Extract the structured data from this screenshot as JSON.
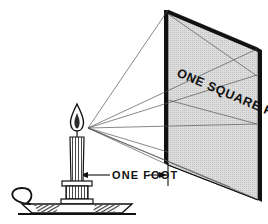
{
  "figure": {
    "background_color": "#ffffff",
    "ink_color": "#111111",
    "panel_fill_color": "#d9d9d9",
    "ray_color": "#555555",
    "width": 268,
    "height": 224
  },
  "labels": {
    "panel_area": "ONE SQUARE FT.",
    "distance": "ONE FOOT"
  },
  "parts": {
    "candle_flame": "candle-flame",
    "candle_body": "candle-body",
    "candle_holder": "candle-holder",
    "candle_saucer": "candle-saucer",
    "saucer_handle": "saucer-handle",
    "light_panel": "light-panel",
    "light_rays": "light-rays",
    "dimension_arrow": "dimension-arrow"
  },
  "geometry": {
    "source_point": [
      88,
      128
    ],
    "panel_corners": {
      "top_left": [
        168,
        10
      ],
      "top_right": [
        258,
        48
      ],
      "bottom_right": [
        258,
        200
      ],
      "bottom_left": [
        168,
        165
      ]
    },
    "distance_value": "1",
    "distance_unit": "foot",
    "area_value": "1",
    "area_unit": "square foot"
  }
}
